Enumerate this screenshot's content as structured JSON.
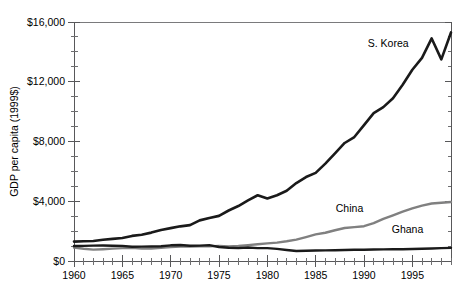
{
  "chart_data": {
    "type": "line",
    "title": "",
    "subtitle": "",
    "xlabel": "",
    "ylabel": "GDP per capita (1999$)",
    "xlim": [
      1960,
      1999
    ],
    "ylim": [
      0,
      16000
    ],
    "grid": false,
    "legend_position": "inline-annotations",
    "x_ticks_major": [
      1960,
      1965,
      1970,
      1975,
      1980,
      1985,
      1990,
      1995
    ],
    "x_tick_labels": [
      "1960",
      "1965",
      "1970",
      "1975",
      "1980",
      "1985",
      "1990",
      "1995"
    ],
    "x_minor_tick_interval": 1,
    "y_ticks_major": [
      0,
      4000,
      8000,
      12000,
      16000
    ],
    "y_tick_labels": [
      "$0",
      "$4,000",
      "$8,000",
      "$12,000",
      "$16,000"
    ],
    "y_minor_tick_interval": 1000,
    "x": [
      1960,
      1961,
      1962,
      1963,
      1964,
      1965,
      1966,
      1967,
      1968,
      1969,
      1970,
      1971,
      1972,
      1973,
      1974,
      1975,
      1976,
      1977,
      1978,
      1979,
      1980,
      1981,
      1982,
      1983,
      1984,
      1985,
      1986,
      1987,
      1988,
      1989,
      1990,
      1991,
      1992,
      1993,
      1994,
      1995,
      1996,
      1997,
      1998,
      1999
    ],
    "series": [
      {
        "name": "S. Korea",
        "color": "#1a1a1a",
        "label_x": 1992.5,
        "label_y": 14300,
        "values": [
          1300,
          1320,
          1340,
          1420,
          1480,
          1540,
          1680,
          1760,
          1900,
          2080,
          2200,
          2320,
          2400,
          2720,
          2880,
          3020,
          3380,
          3680,
          4060,
          4400,
          4180,
          4400,
          4700,
          5220,
          5620,
          5900,
          6520,
          7200,
          7900,
          8300,
          9100,
          9900,
          10300,
          10900,
          11800,
          12800,
          13600,
          14900,
          13500,
          15300
        ]
      },
      {
        "name": "China",
        "color": "#808080",
        "label_x": 1988.5,
        "label_y": 3300,
        "values": [
          900,
          820,
          760,
          790,
          830,
          860,
          880,
          830,
          830,
          880,
          940,
          960,
          960,
          990,
          980,
          1010,
          970,
          1000,
          1060,
          1120,
          1180,
          1230,
          1320,
          1430,
          1600,
          1780,
          1890,
          2060,
          2210,
          2270,
          2330,
          2530,
          2820,
          3060,
          3300,
          3520,
          3710,
          3850,
          3900,
          3950
        ]
      },
      {
        "name": "Ghana",
        "color": "#1a1a1a",
        "label_x": 1994.5,
        "label_y": 1850,
        "values": [
          1000,
          1010,
          1030,
          1040,
          1020,
          1010,
          950,
          960,
          970,
          990,
          1050,
          1070,
          1020,
          1030,
          1060,
          940,
          890,
          860,
          900,
          860,
          860,
          810,
          740,
          670,
          690,
          700,
          710,
          720,
          740,
          750,
          750,
          770,
          780,
          790,
          790,
          800,
          820,
          840,
          860,
          880
        ]
      }
    ]
  },
  "axes": {
    "y_axis_title": "GDP per capita (1999$)"
  }
}
